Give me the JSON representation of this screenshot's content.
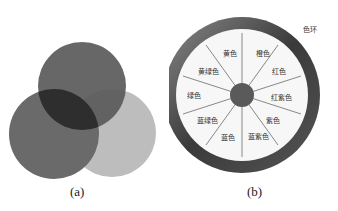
{
  "figure_a": {
    "caption": "(a)",
    "circles": [
      {
        "name": "top",
        "cx": 82,
        "cy": 86,
        "r": 44,
        "color": "#5a5a5a"
      },
      {
        "name": "bottom-left",
        "cx": 54,
        "cy": 134,
        "r": 45,
        "color": "#6a6a6a"
      },
      {
        "name": "bottom-right",
        "cx": 112,
        "cy": 133,
        "r": 44,
        "color": "#bdbdbd"
      }
    ]
  },
  "figure_b": {
    "caption": "(b)",
    "ring_label": "色环",
    "segments": [
      "黄色",
      "橙色",
      "红色",
      "红紫色",
      "紫色",
      "蓝紫色",
      "蓝色",
      "蓝绿色",
      "绿色",
      "黄绿色"
    ],
    "segment_labels": [
      {
        "text": "黄色",
        "x": 61,
        "y": 53
      },
      {
        "text": "橙色",
        "x": 94,
        "y": 53
      },
      {
        "text": "红色",
        "x": 110,
        "y": 71
      },
      {
        "text": "红紫色",
        "x": 112,
        "y": 97
      },
      {
        "text": "紫色",
        "x": 104,
        "y": 120
      },
      {
        "text": "蓝紫色",
        "x": 89,
        "y": 136
      },
      {
        "text": "蓝色",
        "x": 59,
        "y": 137
      },
      {
        "text": "蓝绿色",
        "x": 38,
        "y": 120
      },
      {
        "text": "绿色",
        "x": 25,
        "y": 95
      },
      {
        "text": "黄绿色",
        "x": 39,
        "y": 71
      }
    ]
  }
}
